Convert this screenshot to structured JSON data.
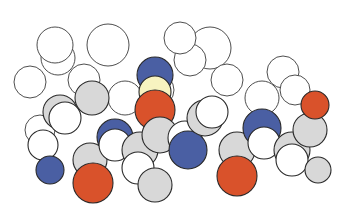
{
  "figure": {
    "type": "space-filling molecular model",
    "legend_colors": {
      "carbon": "#d8d8d8",
      "hydrogen": "#ffffff",
      "nitrogen": "#4a5fa3",
      "oxygen": "#d9522b",
      "sulfur": "#f7f3c0",
      "outline": "#2a2a2a",
      "background_atom": "#ffffff"
    }
  },
  "background_atoms": [
    {
      "cx": 58,
      "cy": 58,
      "r": 17
    },
    {
      "cx": 55,
      "cy": 45,
      "r": 18
    },
    {
      "cx": 108,
      "cy": 45,
      "r": 21
    },
    {
      "cx": 84,
      "cy": 80,
      "r": 16
    },
    {
      "cx": 30,
      "cy": 82,
      "r": 16
    },
    {
      "cx": 125,
      "cy": 98,
      "r": 17
    },
    {
      "cx": 210,
      "cy": 48,
      "r": 21
    },
    {
      "cx": 190,
      "cy": 60,
      "r": 16
    },
    {
      "cx": 227,
      "cy": 80,
      "r": 16
    },
    {
      "cx": 262,
      "cy": 98,
      "r": 17
    },
    {
      "cx": 283,
      "cy": 72,
      "r": 16
    },
    {
      "cx": 295,
      "cy": 90,
      "r": 15
    },
    {
      "cx": 180,
      "cy": 38,
      "r": 16
    },
    {
      "cx": 158,
      "cy": 90,
      "r": 16
    },
    {
      "cx": 40,
      "cy": 130,
      "r": 15
    },
    {
      "cx": 260,
      "cy": 130,
      "r": 16
    }
  ],
  "chain_atoms": [
    {
      "element": "carbon",
      "cx": 60,
      "cy": 112,
      "r": 17
    },
    {
      "element": "carbon",
      "cx": 92,
      "cy": 98,
      "r": 17
    },
    {
      "element": "hydrogen",
      "cx": 65,
      "cy": 118,
      "r": 16
    },
    {
      "element": "hydrogen",
      "cx": 43,
      "cy": 145,
      "r": 15
    },
    {
      "element": "nitrogen",
      "cx": 50,
      "cy": 170,
      "r": 14
    },
    {
      "element": "carbon",
      "cx": 90,
      "cy": 160,
      "r": 17
    },
    {
      "element": "oxygen",
      "cx": 93,
      "cy": 183,
      "r": 20
    },
    {
      "element": "nitrogen",
      "cx": 115,
      "cy": 137,
      "r": 18
    },
    {
      "element": "hydrogen",
      "cx": 115,
      "cy": 145,
      "r": 16
    },
    {
      "element": "carbon",
      "cx": 140,
      "cy": 150,
      "r": 18
    },
    {
      "element": "hydrogen",
      "cx": 138,
      "cy": 168,
      "r": 16
    },
    {
      "element": "carbon",
      "cx": 155,
      "cy": 185,
      "r": 17
    },
    {
      "element": "nitrogen",
      "cx": 155,
      "cy": 75,
      "r": 18
    },
    {
      "element": "sulfur",
      "cx": 155,
      "cy": 92,
      "r": 16
    },
    {
      "element": "oxygen",
      "cx": 155,
      "cy": 110,
      "r": 20
    },
    {
      "element": "carbon",
      "cx": 160,
      "cy": 135,
      "r": 18
    },
    {
      "element": "hydrogen",
      "cx": 185,
      "cy": 138,
      "r": 17
    },
    {
      "element": "nitrogen",
      "cx": 188,
      "cy": 150,
      "r": 19
    },
    {
      "element": "carbon",
      "cx": 205,
      "cy": 118,
      "r": 18
    },
    {
      "element": "hydrogen",
      "cx": 212,
      "cy": 112,
      "r": 16
    },
    {
      "element": "carbon",
      "cx": 237,
      "cy": 150,
      "r": 18
    },
    {
      "element": "oxygen",
      "cx": 237,
      "cy": 176,
      "r": 20
    },
    {
      "element": "nitrogen",
      "cx": 262,
      "cy": 128,
      "r": 19
    },
    {
      "element": "hydrogen",
      "cx": 264,
      "cy": 143,
      "r": 16
    },
    {
      "element": "carbon",
      "cx": 292,
      "cy": 150,
      "r": 18
    },
    {
      "element": "hydrogen",
      "cx": 292,
      "cy": 160,
      "r": 16
    },
    {
      "element": "carbon",
      "cx": 310,
      "cy": 130,
      "r": 17
    },
    {
      "element": "oxygen",
      "cx": 315,
      "cy": 105,
      "r": 14
    },
    {
      "element": "carbon",
      "cx": 318,
      "cy": 170,
      "r": 13
    }
  ]
}
